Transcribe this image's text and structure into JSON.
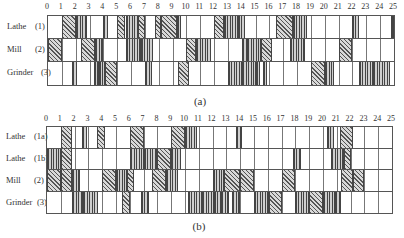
{
  "chart_data": [
    {
      "type": "gantt",
      "title": "(a)",
      "x_ticks": [
        "0",
        "1",
        "2",
        "3",
        "4",
        "5",
        "6",
        "7",
        "8",
        "9",
        "10",
        "11",
        "12",
        "13",
        "14",
        "15",
        "16",
        "17",
        "18",
        "19",
        "20",
        "21",
        "22",
        "23",
        "24",
        "25"
      ],
      "xlim": [
        0,
        25
      ],
      "rows": [
        {
          "label": "Lathe",
          "id": "(1)",
          "blocks": [
            [
              1,
              2,
              "n"
            ],
            [
              2,
              2.8,
              "d"
            ],
            [
              4,
              4.3,
              "d"
            ],
            [
              5,
              5.6,
              "n"
            ],
            [
              5.6,
              6.5,
              "d"
            ],
            [
              6.5,
              7,
              "n"
            ],
            [
              7.7,
              8.2,
              "n"
            ],
            [
              8.2,
              9.3,
              "n"
            ],
            [
              9.3,
              9.6,
              "d"
            ],
            [
              12,
              12.7,
              "n"
            ],
            [
              12.7,
              13.7,
              "d"
            ],
            [
              13.7,
              14.2,
              "d"
            ],
            [
              16.5,
              17.7,
              "n"
            ],
            [
              17.7,
              18.7,
              "d"
            ],
            [
              22,
              22.5,
              "d"
            ],
            [
              24.8,
              25,
              "d"
            ]
          ]
        },
        {
          "label": "Mill",
          "id": "(2)",
          "blocks": [
            [
              0,
              1,
              "n"
            ],
            [
              2.4,
              3.4,
              "n"
            ],
            [
              3.4,
              4,
              "d"
            ],
            [
              5.6,
              6.7,
              "d"
            ],
            [
              6.7,
              7.6,
              "d"
            ],
            [
              10,
              10.7,
              "n"
            ],
            [
              10.7,
              11.8,
              "d"
            ],
            [
              14,
              14.4,
              "d"
            ],
            [
              14.4,
              15.4,
              "d"
            ],
            [
              15.4,
              16.2,
              "n"
            ],
            [
              17.5,
              18.6,
              "d"
            ],
            [
              21,
              22,
              "n"
            ]
          ]
        },
        {
          "label": "Grinder",
          "id": "(3)",
          "blocks": [
            [
              1.7,
              2.1,
              "d"
            ],
            [
              3.3,
              3.7,
              "d"
            ],
            [
              3.7,
              4.1,
              "d"
            ],
            [
              4.1,
              5,
              "n"
            ],
            [
              7,
              7.5,
              "d"
            ],
            [
              9.4,
              10.2,
              "n"
            ],
            [
              13,
              14,
              "d"
            ],
            [
              14,
              15,
              "d"
            ],
            [
              15,
              15.3,
              "d"
            ],
            [
              15.5,
              15.8,
              "d"
            ],
            [
              19,
              20,
              "n"
            ],
            [
              20,
              20.7,
              "d"
            ],
            [
              22.5,
              23.5,
              "d"
            ],
            [
              23.5,
              24.7,
              "d"
            ]
          ]
        }
      ]
    },
    {
      "type": "gantt",
      "title": "(b)",
      "x_ticks": [
        "0",
        "1",
        "2",
        "3",
        "4",
        "5",
        "6",
        "7",
        "8",
        "9",
        "10",
        "11",
        "12",
        "13",
        "14",
        "15",
        "16",
        "17",
        "18",
        "19",
        "20",
        "21",
        "22",
        "23",
        "24",
        "25"
      ],
      "xlim": [
        0,
        25
      ],
      "rows": [
        {
          "label": "Lathe",
          "id": "(1a)",
          "blocks": [
            [
              1,
              1.8,
              "n"
            ],
            [
              2.5,
              2.9,
              "d"
            ],
            [
              3.6,
              4.2,
              "n"
            ],
            [
              6,
              7,
              "n"
            ],
            [
              9,
              10,
              "n"
            ],
            [
              10,
              10.9,
              "d"
            ],
            [
              13.7,
              14.1,
              "d"
            ],
            [
              20.3,
              20.8,
              "d"
            ],
            [
              21.2,
              22.2,
              "n"
            ]
          ]
        },
        {
          "label": "Lathe",
          "id": "(1b)",
          "blocks": [
            [
              0,
              1,
              "d"
            ],
            [
              1,
              1.8,
              "n"
            ],
            [
              6,
              7,
              "d"
            ],
            [
              7,
              8,
              "d"
            ],
            [
              8,
              9,
              "n"
            ],
            [
              9,
              9.7,
              "d"
            ],
            [
              17.8,
              18.4,
              "d"
            ],
            [
              20.6,
              21.5,
              "d"
            ],
            [
              21.5,
              22,
              "n"
            ]
          ]
        },
        {
          "label": "Mill",
          "id": "(2)",
          "blocks": [
            [
              0,
              1,
              "n"
            ],
            [
              1,
              1.8,
              "n"
            ],
            [
              1.8,
              2.4,
              "d"
            ],
            [
              4,
              5,
              "n"
            ],
            [
              5,
              5.8,
              "d"
            ],
            [
              5.8,
              6.3,
              "n"
            ],
            [
              7.6,
              8.6,
              "n"
            ],
            [
              8.6,
              9.5,
              "d"
            ],
            [
              12,
              12.8,
              "d"
            ],
            [
              12.8,
              14,
              "n"
            ],
            [
              14,
              15,
              "n"
            ],
            [
              17,
              18,
              "n"
            ],
            [
              21.3,
              22.2,
              "n"
            ],
            [
              22.2,
              23,
              "n"
            ]
          ]
        },
        {
          "label": "Grinder",
          "id": "(3)",
          "blocks": [
            [
              1.8,
              2.6,
              "d"
            ],
            [
              2.6,
              3.7,
              "d"
            ],
            [
              5.4,
              6,
              "n"
            ],
            [
              6.8,
              7.4,
              "d"
            ],
            [
              10.2,
              11.2,
              "d"
            ],
            [
              11.2,
              12.1,
              "d"
            ],
            [
              12.1,
              12.6,
              "d"
            ],
            [
              12.6,
              13.2,
              "d"
            ],
            [
              13.4,
              14,
              "d"
            ],
            [
              15,
              16.1,
              "d"
            ],
            [
              16.1,
              17,
              "n"
            ],
            [
              18,
              19,
              "d"
            ],
            [
              19,
              20,
              "n"
            ],
            [
              20,
              20.9,
              "d"
            ],
            [
              20.9,
              21.3,
              "d"
            ]
          ]
        }
      ]
    }
  ],
  "captions": {
    "a": "(a)",
    "b": "(b)"
  },
  "charts": {
    "a": {
      "rows": [
        {
          "name": "Lathe",
          "id": "(1)"
        },
        {
          "name": "Mill",
          "id": "(2)"
        },
        {
          "name": "Grinder",
          "id": "(3)"
        }
      ]
    },
    "b": {
      "rows": [
        {
          "name": "Lathe",
          "id": "(1a)"
        },
        {
          "name": "Lathe",
          "id": "(1b)"
        },
        {
          "name": "Mill",
          "id": "(2)"
        },
        {
          "name": "Grinder",
          "id": "(3)"
        }
      ]
    }
  }
}
